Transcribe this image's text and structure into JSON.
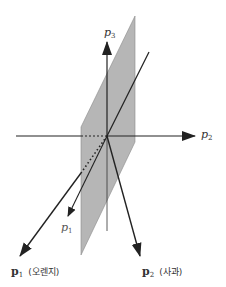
{
  "diagram": {
    "type": "3d-vector-space",
    "colors": {
      "plane_fill": "#a9a9a9",
      "plane_edge": "#8a8a8a",
      "axis": "#222222",
      "label": "#333333"
    },
    "axes": {
      "p3": {
        "var": "p",
        "sub": "3"
      },
      "p2": {
        "var": "p",
        "sub": "2"
      },
      "p1": {
        "var": "p",
        "sub": "1"
      }
    },
    "vectors": {
      "orange": {
        "var": "p",
        "sub": "1",
        "name": "(오렌지)"
      },
      "apple": {
        "var": "p",
        "sub": "2",
        "name": "(사과)"
      }
    }
  }
}
